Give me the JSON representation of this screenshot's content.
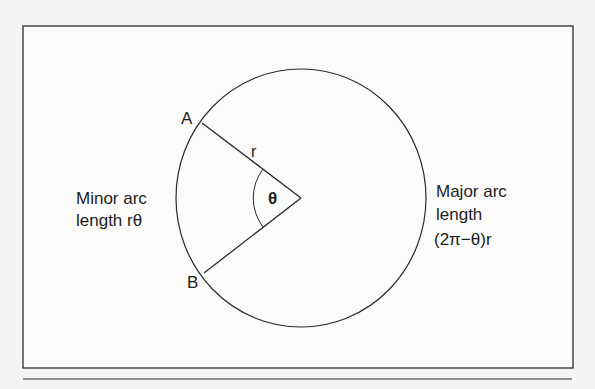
{
  "diagram": {
    "points": {
      "a_label": "A",
      "b_label": "B"
    },
    "radius_label": "r",
    "angle_label": "θ",
    "minor_arc": {
      "line1": "Minor arc",
      "line2": "length rθ"
    },
    "major_arc": {
      "line1": "Major arc",
      "line2": "length",
      "line3": "(2π−θ)r"
    },
    "colors": {
      "ink": "#1e1e1e",
      "paper": "#f4f4f2",
      "frame_fill": "#ffffff"
    }
  }
}
